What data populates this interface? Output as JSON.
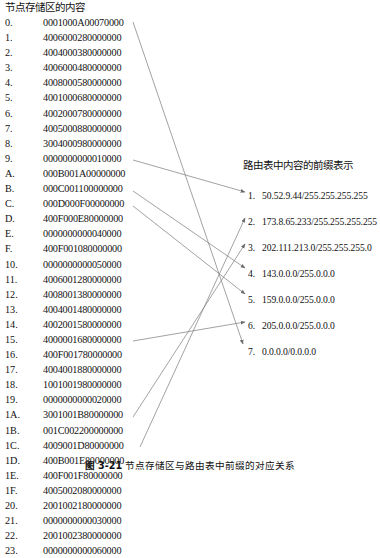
{
  "figure": {
    "memory_panel": {
      "title": "节点存储区的内容",
      "rows": [
        {
          "index": "0.",
          "value": "0001000A00070000"
        },
        {
          "index": "1.",
          "value": "4006000280000000"
        },
        {
          "index": "2.",
          "value": "4004000380000000"
        },
        {
          "index": "3.",
          "value": "4006000480000000"
        },
        {
          "index": "4.",
          "value": "4008000580000000"
        },
        {
          "index": "5.",
          "value": "4001000680000000"
        },
        {
          "index": "6.",
          "value": "4002000780000000"
        },
        {
          "index": "7.",
          "value": "4005000880000000"
        },
        {
          "index": "8.",
          "value": "3004000980000000"
        },
        {
          "index": "9.",
          "value": "0000000000010000"
        },
        {
          "index": "A.",
          "value": "000B001A00000000"
        },
        {
          "index": "B.",
          "value": "000C001100000000"
        },
        {
          "index": "C.",
          "value": "000D000F00000000"
        },
        {
          "index": "D.",
          "value": "400F000E80000000"
        },
        {
          "index": "E.",
          "value": "0000000000040000"
        },
        {
          "index": "F.",
          "value": "400F001080000000"
        },
        {
          "index": "10.",
          "value": "0000000000050000"
        },
        {
          "index": "11.",
          "value": "4006001280000000"
        },
        {
          "index": "12.",
          "value": "4008001380000000"
        },
        {
          "index": "13.",
          "value": "4004001480000000"
        },
        {
          "index": "14.",
          "value": "4002001580000000"
        },
        {
          "index": "15.",
          "value": "4000001680000000"
        },
        {
          "index": "16.",
          "value": "400F001780000000"
        },
        {
          "index": "17.",
          "value": "4004001880000000"
        },
        {
          "index": "18.",
          "value": "1001001980000000"
        },
        {
          "index": "19.",
          "value": "0000000000020000"
        },
        {
          "index": "1A.",
          "value": "3001001B80000000"
        },
        {
          "index": "1B.",
          "value": "001C002200000000"
        },
        {
          "index": "1C.",
          "value": "4009001D80000000"
        },
        {
          "index": "1D.",
          "value": "400B001E80000000"
        },
        {
          "index": "1E.",
          "value": "400F001F80000000"
        },
        {
          "index": "1F.",
          "value": "4005002080000000"
        },
        {
          "index": "20.",
          "value": "2001002180000000"
        },
        {
          "index": "21.",
          "value": "0000000000030000"
        },
        {
          "index": "22.",
          "value": "2001002380000000"
        },
        {
          "index": "23.",
          "value": "0000000000060000"
        }
      ]
    },
    "prefix_panel": {
      "title": "路由表中内容的前缀表示",
      "entries": [
        {
          "num": "1.",
          "prefix": "50.52.9.44/255.255.255.255"
        },
        {
          "num": "2.",
          "prefix": "173.8.65.233/255.255.255.255"
        },
        {
          "num": "3.",
          "prefix": "202.111.213.0/255.255.255.0"
        },
        {
          "num": "4.",
          "prefix": "143.0.0.0/255.0.0.0"
        },
        {
          "num": "5.",
          "prefix": "159.0.0.0/255.0.0.0"
        },
        {
          "num": "6.",
          "prefix": "205.0.0.0/255.0.0.0"
        },
        {
          "num": "7.",
          "prefix": "0.0.0.0/0.0.0.0"
        }
      ]
    },
    "caption": {
      "label": "图 3-21",
      "text": "节点存储区与路由表中前缀的对应关系"
    },
    "style": {
      "line_color": "#8a8a8a",
      "text_color": "#111111",
      "background": "#ffffff"
    }
  }
}
